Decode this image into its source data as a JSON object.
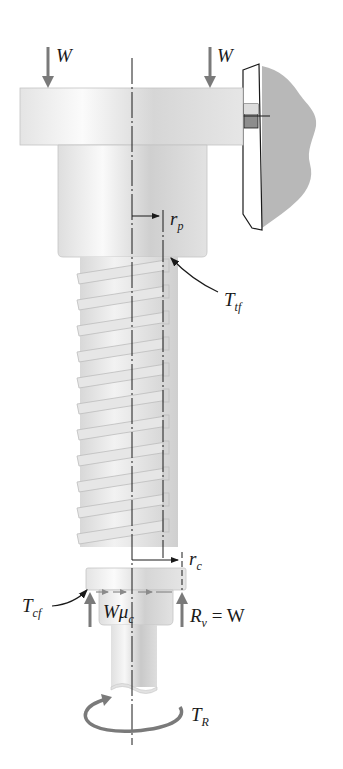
{
  "figure": {
    "type": "power screw free-body diagram",
    "colors": {
      "metal_light": "#efefef",
      "metal_mid": "#d9d9d9",
      "metal_dark": "#bdbdbd",
      "force_arrow": "#7a7a7a",
      "wall": "#b8b8b8",
      "line": "#1a1a1a"
    }
  },
  "labels": {
    "load_left": {
      "main": "W"
    },
    "load_right": {
      "main": "W"
    },
    "pitch_radius": {
      "main": "r",
      "sub": "p"
    },
    "thread_friction_torque": {
      "main": "T",
      "sub": "tf"
    },
    "collar_radius": {
      "main": "r",
      "sub": "c"
    },
    "collar_friction_torque": {
      "main": "T",
      "sub": "cf"
    },
    "collar_friction_force": {
      "main": "Wμ",
      "sub": "c"
    },
    "reaction": {
      "main": "R",
      "sub": "v",
      "rest": " = W"
    },
    "applied_torque": {
      "main": "T",
      "sub": "R"
    }
  }
}
